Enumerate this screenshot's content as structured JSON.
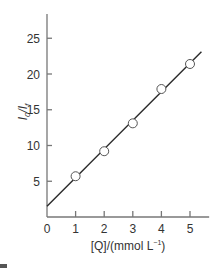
{
  "chart_data": {
    "type": "scatter",
    "title": "",
    "xlabel": "[Q]/(mmol L⁻¹)",
    "ylabel": "I₀/I_f",
    "xlim": [
      0,
      5.6
    ],
    "ylim": [
      0,
      27
    ],
    "x_ticks": [
      0,
      1,
      2,
      3,
      4,
      5
    ],
    "y_ticks": [
      5,
      10,
      15,
      20,
      25
    ],
    "grid": false,
    "legend": null,
    "series": [
      {
        "name": "data",
        "marker": "open-circle",
        "x": [
          1,
          2,
          3,
          4,
          5
        ],
        "y": [
          5.7,
          9.2,
          13.1,
          17.9,
          21.4
        ]
      }
    ],
    "fit_line": {
      "type": "linear",
      "intercept": 1.5,
      "slope": 4.0,
      "x_range": [
        0,
        5.4
      ]
    }
  },
  "labels": {
    "x_axis": "[Q]/(mmol L",
    "x_axis_sup": "−1",
    "x_axis_close": ")",
    "y_axis_main": "I",
    "y_axis_sub1": "0",
    "y_axis_mid": "/I",
    "y_axis_sub2": "f"
  },
  "colors": {
    "axis": "#777777",
    "line": "#2a2a2a",
    "marker_edge": "#555555",
    "text": "#333333"
  }
}
